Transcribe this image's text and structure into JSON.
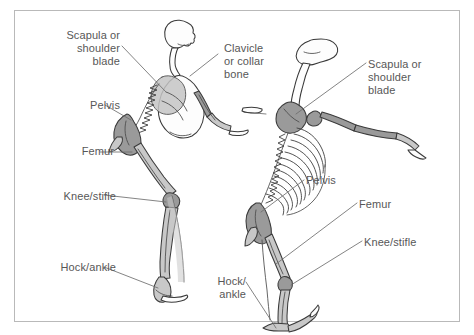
{
  "figure": {
    "background_color": "#ffffff",
    "frame_color": "#b9b9b9",
    "label_color": "#575757",
    "leader_line_color": "#6e6e6e",
    "bone_outline_color": "#3a3a3a",
    "bone_fill_light": "#fdfdfd",
    "bone_fill_mid": "#c8c8c8",
    "bone_fill_dark": "#9a9a9a",
    "highlight_fill": "#c4c4c4"
  },
  "left_figure": {
    "name": "lateral-side-view-skeleton",
    "labels": [
      {
        "id": "scapula",
        "text": "Scapula or\nshoulder\nblade",
        "align": "right",
        "x": 24,
        "y": 29,
        "width": 96
      },
      {
        "id": "pelvis",
        "text": "Pelvis",
        "align": "right",
        "x": 52,
        "y": 99,
        "width": 68
      },
      {
        "id": "femur",
        "text": "Femur",
        "align": "right",
        "x": 46,
        "y": 145,
        "width": 68
      },
      {
        "id": "knee-stifle",
        "text": "Knee/stifle",
        "align": "right",
        "x": 20,
        "y": 190,
        "width": 96
      },
      {
        "id": "hock-ankle",
        "text": "Hock/ankle",
        "align": "right",
        "x": 16,
        "y": 261,
        "width": 100
      }
    ]
  },
  "right_figure": {
    "name": "front-three-quarter-view-skeleton",
    "labels": [
      {
        "id": "clavicle",
        "text": "Clavicle\nor collar\nbone",
        "align": "left",
        "x": 224,
        "y": 42,
        "width": 76
      },
      {
        "id": "scapula",
        "text": "Scapula or\nshoulder\nblade",
        "align": "left",
        "x": 368,
        "y": 58,
        "width": 92
      },
      {
        "id": "pelvis",
        "text": "Pelvis",
        "align": "left",
        "x": 306,
        "y": 174,
        "width": 60
      },
      {
        "id": "femur",
        "text": "Femur",
        "align": "left",
        "x": 359,
        "y": 198,
        "width": 62
      },
      {
        "id": "knee-stifle",
        "text": "Knee/stifle",
        "align": "left",
        "x": 364,
        "y": 236,
        "width": 90
      },
      {
        "id": "hock-ankle",
        "text": "Hock/\nankle",
        "align": "right",
        "x": 196,
        "y": 275,
        "width": 50
      }
    ]
  }
}
